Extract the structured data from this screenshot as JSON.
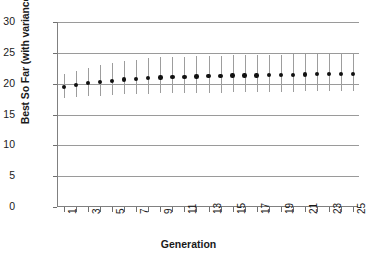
{
  "chart_data": {
    "type": "scatter",
    "title": "",
    "xlabel": "Generation",
    "ylabel": "Best So Far (with variance bars)",
    "xlim": [
      0.5,
      25.5
    ],
    "ylim": [
      0,
      30
    ],
    "grid": true,
    "legend": null,
    "y_ticks": [
      0,
      5,
      10,
      15,
      20,
      25,
      30
    ],
    "y_tick_labels": [
      "0",
      "5",
      "10",
      "15",
      "20",
      "25",
      "30"
    ],
    "x_ticks": [
      1,
      2,
      3,
      4,
      5,
      6,
      7,
      8,
      9,
      10,
      11,
      12,
      13,
      14,
      15,
      16,
      17,
      18,
      19,
      20,
      21,
      22,
      23,
      24,
      25
    ],
    "x_tick_labels": [
      "1",
      "",
      "3",
      "",
      "5",
      "",
      "7",
      "",
      "9",
      "",
      "11",
      "",
      "13",
      "",
      "15",
      "",
      "17",
      "",
      "19",
      "",
      "21",
      "",
      "23",
      "",
      "25"
    ],
    "categories": [
      1,
      2,
      3,
      4,
      5,
      6,
      7,
      8,
      9,
      10,
      11,
      12,
      13,
      14,
      15,
      16,
      17,
      18,
      19,
      20,
      21,
      22,
      23,
      24,
      25
    ],
    "series": [
      {
        "name": "Best So Far",
        "values": [
          19.5,
          19.8,
          20.1,
          20.25,
          20.45,
          20.65,
          20.75,
          20.9,
          21.0,
          21.05,
          21.1,
          21.15,
          21.2,
          21.25,
          21.3,
          21.35,
          21.35,
          21.4,
          21.4,
          21.45,
          21.5,
          21.55,
          21.55,
          21.6,
          21.6
        ],
        "err_low": [
          1.9,
          2.0,
          2.1,
          2.2,
          2.3,
          2.4,
          2.45,
          2.5,
          2.55,
          2.6,
          2.6,
          2.65,
          2.65,
          2.7,
          2.7,
          2.7,
          2.7,
          2.7,
          2.75,
          2.75,
          2.75,
          2.75,
          2.8,
          2.8,
          2.8
        ],
        "err_high": [
          2.0,
          2.2,
          2.5,
          2.7,
          2.9,
          3.0,
          3.1,
          3.2,
          3.25,
          3.3,
          3.3,
          3.3,
          3.3,
          3.3,
          3.3,
          3.3,
          3.3,
          3.3,
          3.3,
          3.3,
          3.3,
          3.3,
          3.3,
          3.3,
          3.3
        ]
      }
    ],
    "marker_color": "#111111",
    "errorbar_color": "#9d9d9d",
    "grid_color": "#9a9a9a",
    "axis_color": "#808080"
  }
}
